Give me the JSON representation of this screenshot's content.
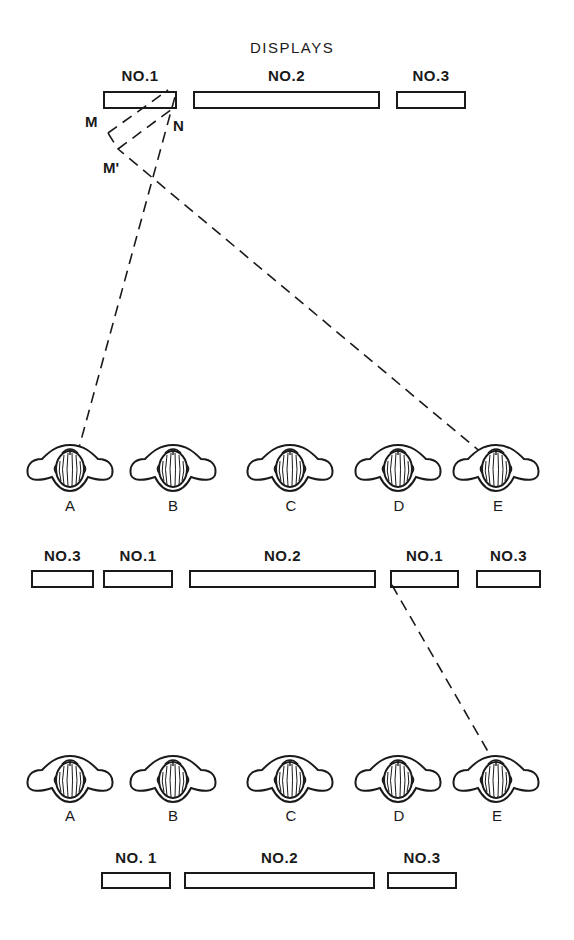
{
  "title": "DISPLAYS",
  "point_labels": {
    "M": "M",
    "N": "N",
    "M_prime": "M'"
  },
  "rows": [
    {
      "id": "top",
      "displays": [
        {
          "label": "NO.1",
          "x": 103,
          "y": 91,
          "w": 74,
          "h": 18
        },
        {
          "label": "NO.2",
          "x": 193,
          "y": 91,
          "w": 187,
          "h": 18
        },
        {
          "label": "NO.3",
          "x": 396,
          "y": 91,
          "w": 70,
          "h": 18
        }
      ]
    },
    {
      "id": "middle",
      "displays": [
        {
          "label": "NO.3",
          "x": 31,
          "y": 570,
          "w": 63,
          "h": 18
        },
        {
          "label": "NO.1",
          "x": 103,
          "y": 570,
          "w": 70,
          "h": 18
        },
        {
          "label": "NO.2",
          "x": 189,
          "y": 570,
          "w": 187,
          "h": 18
        },
        {
          "label": "NO.1",
          "x": 390,
          "y": 570,
          "w": 69,
          "h": 18
        },
        {
          "label": "NO.3",
          "x": 476,
          "y": 570,
          "w": 65,
          "h": 18
        }
      ]
    },
    {
      "id": "bottom",
      "displays": [
        {
          "label": "NO. 1",
          "x": 101,
          "y": 872,
          "w": 70,
          "h": 17
        },
        {
          "label": "NO.2",
          "x": 184,
          "y": 872,
          "w": 191,
          "h": 17
        },
        {
          "label": "NO.3",
          "x": 387,
          "y": 872,
          "w": 70,
          "h": 17
        }
      ]
    }
  ],
  "observer_rows": [
    {
      "y": 467,
      "people": [
        {
          "label": "A",
          "x": 70
        },
        {
          "label": "B",
          "x": 173
        },
        {
          "label": "C",
          "x": 290
        },
        {
          "label": "D",
          "x": 398
        },
        {
          "label": "E",
          "x": 496
        }
      ]
    },
    {
      "y": 778,
      "people": [
        {
          "label": "A",
          "x": 70
        },
        {
          "label": "B",
          "x": 173
        },
        {
          "label": "C",
          "x": 290
        },
        {
          "label": "D",
          "x": 398
        },
        {
          "label": "E",
          "x": 496
        }
      ]
    }
  ],
  "sight_lines": [
    {
      "from": [
        77,
        455
      ],
      "to": [
        176,
        93
      ]
    },
    {
      "from": [
        483,
        454
      ],
      "to": [
        118,
        149
      ]
    },
    {
      "from": [
        118,
        149
      ],
      "to": [
        176,
        106
      ]
    },
    {
      "from": [
        108,
        133
      ],
      "to": [
        168,
        90
      ]
    },
    {
      "from": [
        108,
        133
      ],
      "to": [
        118,
        149
      ]
    },
    {
      "from": [
        392,
        585
      ],
      "to": [
        494,
        762
      ]
    }
  ]
}
